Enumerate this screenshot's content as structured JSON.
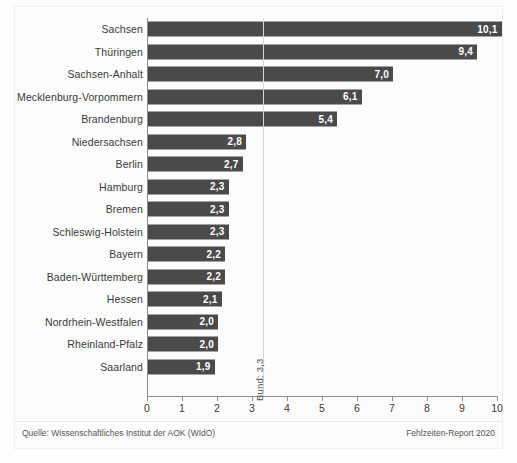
{
  "chart_data": {
    "type": "bar",
    "orientation": "horizontal",
    "title": "",
    "subtitle": "",
    "xlabel": "",
    "ylabel": "",
    "xlim": [
      0,
      10
    ],
    "grid": false,
    "legend": null,
    "categories": [
      "Sachsen",
      "Thüringen",
      "Sachsen-Anhalt",
      "Mecklenburg-Vorpommern",
      "Brandenburg",
      "Niedersachsen",
      "Berlin",
      "Hamburg",
      "Bremen",
      "Schleswig-Holstein",
      "Bayern",
      "Baden-Württemberg",
      "Hessen",
      "Nordrhein-Westfalen",
      "Rheinland-Pfalz",
      "Saarland"
    ],
    "values": [
      10.1,
      9.4,
      7.0,
      6.1,
      5.4,
      2.8,
      2.7,
      2.3,
      2.3,
      2.3,
      2.2,
      2.2,
      2.1,
      2.0,
      2.0,
      1.9
    ],
    "value_labels": [
      "10,1",
      "9,4",
      "7,0",
      "6,1",
      "5,4",
      "2,8",
      "2,7",
      "2,3",
      "2,3",
      "2,3",
      "2,2",
      "2,2",
      "2,1",
      "2,0",
      "2,0",
      "1,9"
    ],
    "tick_labels": [
      "0",
      "1",
      "2",
      "3",
      "4",
      "5",
      "6",
      "7",
      "8",
      "9",
      "10"
    ],
    "tick_values": [
      0,
      1,
      2,
      3,
      4,
      5,
      6,
      7,
      8,
      9,
      10
    ],
    "reference_line": {
      "label": "Bund: 3,3",
      "value": 3.3
    },
    "bar_color": "#4a4a4a",
    "value_label_color": "#ffffff",
    "axis_color": "#8d8d8d"
  },
  "footer": {
    "source": "Quelle: Wissenschaftliches Institut der AOK (WIdO)",
    "report": "Fehlzeiten-Report 2020"
  }
}
